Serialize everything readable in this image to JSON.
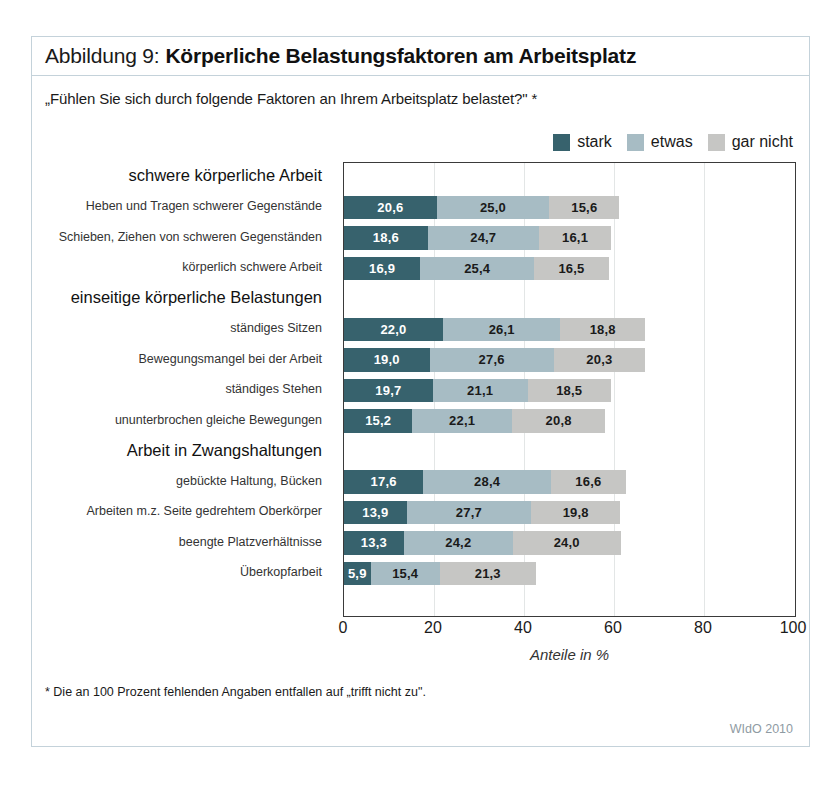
{
  "figure": {
    "title_prefix": "Abbildung 9:",
    "title_main": "Körperliche Belastungsfaktoren am Arbeitsplatz",
    "subtitle": "„Fühlen Sie sich durch folgende Faktoren an Ihrem Arbeitsplatz belastet?\" *",
    "footnote": "* Die an 100 Prozent fehlenden Angaben entfallen auf „trifft nicht zu\".",
    "source": "WIdO 2010"
  },
  "colors": {
    "stark": "#37626d",
    "etwas": "#a7bcc4",
    "gar_nicht": "#c6c6c4",
    "frame": "#c4d2da",
    "plot_border": "#3a3a3a",
    "gridline": "#e3e6e6"
  },
  "chart_data": {
    "type": "bar",
    "orientation": "horizontal",
    "stacked": true,
    "title": "Körperliche Belastungsfaktoren am Arbeitsplatz",
    "subtitle": "„Fühlen Sie sich durch folgende Faktoren an Ihrem Arbeitsplatz belastet?\" *",
    "xlabel": "Anteile in %",
    "ylabel": "",
    "xlim": [
      0,
      100
    ],
    "xticks": [
      "0",
      "20",
      "40",
      "60",
      "80",
      "100"
    ],
    "grid": true,
    "legend_position": "top-right",
    "legend": [
      "stark",
      "etwas",
      "gar nicht"
    ],
    "series": [
      {
        "name": "stark",
        "values": [
          20.6,
          18.6,
          16.9,
          22.0,
          19.0,
          19.7,
          15.2,
          17.6,
          13.9,
          13.3,
          5.9
        ]
      },
      {
        "name": "etwas",
        "values": [
          25.0,
          24.7,
          25.4,
          26.1,
          27.6,
          21.1,
          22.1,
          28.4,
          27.7,
          24.2,
          15.4
        ]
      },
      {
        "name": "gar nicht",
        "values": [
          15.6,
          16.1,
          16.5,
          18.8,
          20.3,
          18.5,
          20.8,
          16.6,
          19.8,
          24.0,
          21.3
        ]
      }
    ],
    "categories": [
      "Heben und Tragen schwerer Gegenstände",
      "Schieben, Ziehen von schweren Gegenständen",
      "körperlich schwere Arbeit",
      "ständiges Sitzen",
      "Bewegungsmangel bei der Arbeit",
      "ständiges Stehen",
      "ununterbrochen gleiche Bewegungen",
      "gebückte Haltung, Bücken",
      "Arbeiten m.z. Seite gedrehtem Oberkörper",
      "beengte Platzverhältnisse",
      "Überkopfarbeit"
    ],
    "groups": [
      {
        "label": "schwere körperliche Arbeit",
        "items": [
          0,
          1,
          2
        ]
      },
      {
        "label": "einseitige körperliche Belastungen",
        "items": [
          3,
          4,
          5,
          6
        ]
      },
      {
        "label": "Arbeit in Zwangshaltungen",
        "items": [
          7,
          8,
          9,
          10
        ]
      }
    ],
    "value_labels": {
      "stark": [
        "20,6",
        "18,6",
        "16,9",
        "22,0",
        "19,0",
        "19,7",
        "15,2",
        "17,6",
        "13,9",
        "13,3",
        "5,9"
      ],
      "etwas": [
        "25,0",
        "24,7",
        "25,4",
        "26,1",
        "27,6",
        "21,1",
        "22,1",
        "28,4",
        "27,7",
        "24,2",
        "15,4"
      ],
      "gar nicht": [
        "15,6",
        "16,1",
        "16,5",
        "18,8",
        "20,3",
        "18,5",
        "20,8",
        "16,6",
        "19,8",
        "24,0",
        "21,3"
      ]
    }
  }
}
